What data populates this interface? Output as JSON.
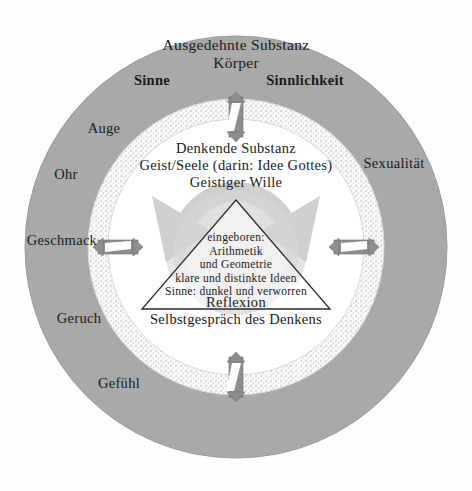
{
  "diagram": {
    "name": "descartes-two-substances-diagram",
    "colors": {
      "outer_ring": "#a9a9a9",
      "middle_ring_stipple": "#f2f2f2",
      "inner_circle": "#ffffff",
      "reflexion_loop": "#cfcfcf",
      "arrow_gray": "#8e8e8e",
      "text": "#1a1a1a",
      "background": "#ffffff"
    },
    "outer_ring": {
      "title_line_1": "Ausgedehnte Substanz",
      "title_line_2": "Körper",
      "left_heading": "Sinne",
      "right_heading": "Sinnlichkeit",
      "senses": [
        {
          "label": "Auge"
        },
        {
          "label": "Ohr"
        },
        {
          "label": "Geschmack"
        },
        {
          "label": "Geruch"
        },
        {
          "label": "Gefühl"
        }
      ],
      "right_label": "Sexualität"
    },
    "middle_ring": {
      "name": "stippled-boundary-ring",
      "arrows": [
        {
          "position": "top",
          "orientation": "vertical",
          "heads": "double"
        },
        {
          "position": "left",
          "orientation": "horizontal",
          "heads": "double"
        },
        {
          "position": "right",
          "orientation": "horizontal",
          "heads": "double"
        },
        {
          "position": "bottom",
          "orientation": "vertical",
          "heads": "double"
        }
      ]
    },
    "inner_circle": {
      "title_line_1": "Denkende Substanz",
      "title_line_2": "Geist/Seele (darin: Idee Gottes)",
      "title_line_3": "Geistiger Wille",
      "reflexion_line_1": "Reflexion",
      "reflexion_line_2": "Selbstgespräch des Denkens"
    },
    "triangle": {
      "name": "innate-ideas-triangle",
      "lines": [
        "eingeboren:",
        "Arithmetik",
        "und Geometrie",
        "klare und distinkte Ideen",
        "Sinne: dunkel und verworren"
      ]
    }
  }
}
